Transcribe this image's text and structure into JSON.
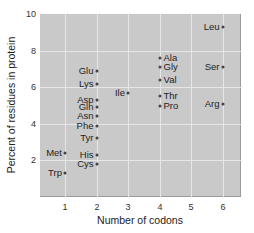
{
  "chart_data": {
    "type": "scatter",
    "title": "",
    "xlabel": "Number of codons",
    "ylabel": "Percent of residues in protein",
    "xlim": [
      0.1,
      6.6
    ],
    "ylim": [
      0,
      10
    ],
    "x_ticks": [
      "1",
      "2",
      "3",
      "4",
      "5",
      "6"
    ],
    "y_ticks": [
      "2",
      "4",
      "6",
      "8",
      "10"
    ],
    "grid": true,
    "legend": null,
    "points": [
      {
        "label": "Met",
        "x": 1,
        "y": 2.4,
        "label_side": "left"
      },
      {
        "label": "Trp",
        "x": 1,
        "y": 1.3,
        "label_side": "left"
      },
      {
        "label": "Glu",
        "x": 2,
        "y": 6.9,
        "label_side": "left"
      },
      {
        "label": "Lys",
        "x": 2,
        "y": 6.2,
        "label_side": "left"
      },
      {
        "label": "Asp",
        "x": 2,
        "y": 5.3,
        "label_side": "left"
      },
      {
        "label": "Gln",
        "x": 2,
        "y": 4.9,
        "label_side": "left"
      },
      {
        "label": "Asn",
        "x": 2,
        "y": 4.4,
        "label_side": "left"
      },
      {
        "label": "Phe",
        "x": 2,
        "y": 3.9,
        "label_side": "left"
      },
      {
        "label": "Tyr",
        "x": 2,
        "y": 3.2,
        "label_side": "left"
      },
      {
        "label": "His",
        "x": 2,
        "y": 2.3,
        "label_side": "left"
      },
      {
        "label": "Cys",
        "x": 2,
        "y": 1.8,
        "label_side": "left"
      },
      {
        "label": "Ile",
        "x": 3,
        "y": 5.7,
        "label_side": "left"
      },
      {
        "label": "Ala",
        "x": 4,
        "y": 7.6,
        "label_side": "right"
      },
      {
        "label": "Gly",
        "x": 4,
        "y": 7.1,
        "label_side": "right"
      },
      {
        "label": "Val",
        "x": 4,
        "y": 6.4,
        "label_side": "right"
      },
      {
        "label": "Thr",
        "x": 4,
        "y": 5.5,
        "label_side": "right"
      },
      {
        "label": "Pro",
        "x": 4,
        "y": 5.0,
        "label_side": "right"
      },
      {
        "label": "Leu",
        "x": 6,
        "y": 9.3,
        "label_side": "left"
      },
      {
        "label": "Ser",
        "x": 6,
        "y": 7.1,
        "label_side": "left"
      },
      {
        "label": "Arg",
        "x": 6,
        "y": 5.1,
        "label_side": "left"
      }
    ]
  },
  "colors": {
    "plot_background": "#c9c9c9",
    "gridline": "#e6e6e6",
    "marker": "#444444"
  }
}
